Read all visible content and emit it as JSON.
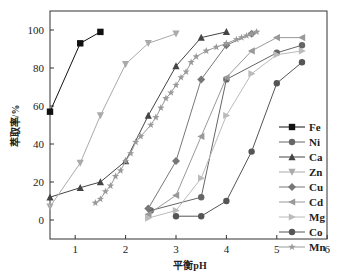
{
  "chart_data": {
    "type": "line",
    "title": "",
    "xlabel": "平衡pH",
    "ylabel": "萃取率/%",
    "xlim": [
      0.5,
      6
    ],
    "ylim": [
      -10,
      110
    ],
    "xticks": [
      1,
      2,
      3,
      4,
      5,
      6
    ],
    "yticks": [
      0,
      20,
      40,
      60,
      80,
      100
    ],
    "grid": false,
    "legend_position": "lower right inside",
    "series": [
      {
        "name": "Fe",
        "marker": "square",
        "color": "#111111",
        "x": [
          0.5,
          1.1,
          1.5
        ],
        "y": [
          57,
          93,
          99
        ]
      },
      {
        "name": "Ni",
        "marker": "circle",
        "color": "#666666",
        "x": [
          2.5,
          3.5,
          4.0,
          5.0,
          5.5
        ],
        "y": [
          5,
          12,
          74,
          88,
          92
        ]
      },
      {
        "name": "Ca",
        "marker": "triangle-up",
        "color": "#444444",
        "x": [
          0.5,
          1.1,
          1.5,
          2.0,
          2.45,
          3.0,
          3.5,
          4.0
        ],
        "y": [
          12,
          17,
          20,
          31,
          55,
          81,
          96,
          99
        ]
      },
      {
        "name": "Zn",
        "marker": "triangle-down",
        "color": "#aaaaaa",
        "x": [
          0.5,
          1.1,
          1.5,
          2.0,
          2.45,
          3.0
        ],
        "y": [
          7,
          30,
          55,
          82,
          93,
          98
        ]
      },
      {
        "name": "Cu",
        "marker": "diamond",
        "color": "#777777",
        "x": [
          2.45,
          3.0,
          3.5,
          4.0,
          4.5
        ],
        "y": [
          6,
          31,
          74,
          92,
          98
        ]
      },
      {
        "name": "Cd",
        "marker": "triangle-left",
        "color": "#999999",
        "x": [
          2.45,
          3.0,
          3.5,
          4.0,
          4.5,
          5.0,
          5.5
        ],
        "y": [
          3,
          13,
          44,
          75,
          89,
          96,
          96
        ]
      },
      {
        "name": "Mg",
        "marker": "triangle-right",
        "color": "#bbbbbb",
        "x": [
          2.45,
          3.0,
          3.5,
          4.0,
          4.5,
          5.0,
          5.5
        ],
        "y": [
          1,
          5,
          22,
          55,
          77,
          87,
          89
        ]
      },
      {
        "name": "Co",
        "marker": "circle",
        "color": "#555555",
        "x": [
          3.0,
          3.5,
          4.0,
          4.5,
          5.0,
          5.5
        ],
        "y": [
          2,
          2,
          10,
          36,
          72,
          83
        ]
      },
      {
        "name": "Mn",
        "marker": "star",
        "color": "#9a9a9a",
        "x": [
          1.4,
          1.5,
          1.6,
          1.7,
          1.8,
          1.9,
          2.0,
          2.1,
          2.2,
          2.3,
          2.5,
          2.6,
          2.7,
          2.8,
          2.9,
          3.0,
          3.1,
          3.2,
          3.3,
          3.4,
          3.6,
          3.8,
          4.0,
          4.2,
          4.3,
          4.4,
          4.5,
          4.6
        ],
        "y": [
          9,
          11,
          15,
          18,
          23,
          26,
          31,
          35,
          41,
          44,
          50,
          54,
          59,
          64,
          67,
          71,
          75,
          78,
          83,
          86,
          89,
          91,
          93,
          95,
          96,
          97,
          98,
          99
        ]
      }
    ]
  }
}
